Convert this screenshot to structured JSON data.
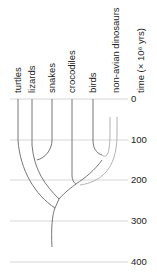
{
  "diagram": {
    "type": "cladogram",
    "taxa": [
      {
        "label": "turtles"
      },
      {
        "label": "lizards"
      },
      {
        "label": "snakes"
      },
      {
        "label": "crocodiles"
      },
      {
        "label": "birds"
      },
      {
        "label": "non-avian dinosaurs"
      }
    ],
    "axis": {
      "label": "time (× 10⁶ yrs)",
      "ticks": [
        "0",
        "100",
        "200",
        "300",
        "400"
      ]
    },
    "colors": {
      "branch": "#666666",
      "extinct_branch": "#aaaaaa",
      "grid": "#cccccc",
      "text": "#222222"
    }
  }
}
